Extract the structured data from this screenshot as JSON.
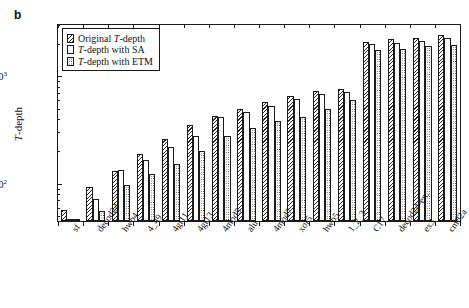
{
  "panel": {
    "label": "b"
  },
  "axes": {
    "ylabel": "T-depth",
    "ylabel_italic_prefix": "T",
    "ylabel_rest": "-depth",
    "ytick_labels": [
      "10³",
      "10²"
    ],
    "ytick_exponents": [
      "3",
      "2"
    ],
    "ytick_base": "10",
    "xlabel": ""
  },
  "legend": {
    "position": "top-left-inside",
    "items": [
      {
        "pattern": "diagonal-hatch",
        "label_prefix": "Original ",
        "label_italic": "T",
        "label_rest": "-depth",
        "label": "Original T-depth"
      },
      {
        "pattern": "plain-white",
        "label_prefix": "",
        "label_italic": "T",
        "label_rest": "-depth with SA",
        "label": "T-depth with SA"
      },
      {
        "pattern": "dotted",
        "label_prefix": "",
        "label_italic": "T",
        "label_rest": "-depth with ETM",
        "label": "T-depth with ETM"
      }
    ]
  },
  "chart_data": {
    "type": "bar",
    "title": "",
    "xlabel": "",
    "ylabel": "T-depth",
    "yscale": "log",
    "ylim": [
      45,
      3000
    ],
    "grid": false,
    "legend_position": "upper left",
    "categories": [
      "sf",
      "decod24",
      "hwb4",
      "4_49",
      "4gt11",
      "4gt13",
      "4mod5",
      "alu",
      "4mod7",
      "xor5",
      "hwb5",
      "1_2_3",
      "C17",
      "decod24-en.",
      "ex3",
      "cm82a"
    ],
    "series": [
      {
        "name": "Original T-depth",
        "pattern": "diagonal-hatch",
        "values": [
          57,
          93,
          132,
          190,
          262,
          350,
          430,
          500,
          580,
          660,
          730,
          760,
          2100,
          2200,
          2250,
          2400
        ]
      },
      {
        "name": "T-depth with SA",
        "pattern": "plain-white",
        "values": [
          38,
          72,
          135,
          168,
          218,
          280,
          420,
          470,
          530,
          610,
          690,
          720,
          2000,
          2050,
          2150,
          2250
        ]
      },
      {
        "name": "T-depth with ETM",
        "pattern": "dotted",
        "values": [
          30,
          56,
          98,
          124,
          152,
          200,
          280,
          330,
          380,
          420,
          500,
          600,
          1750,
          1800,
          1900,
          1950
        ]
      }
    ]
  }
}
